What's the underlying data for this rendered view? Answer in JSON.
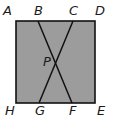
{
  "diagram": {
    "type": "geometry",
    "colors": {
      "fill": "#9c9c9c",
      "stroke": "#111111",
      "label": "#1a1a1a"
    },
    "rectangle": {
      "vertices": [
        "A",
        "D",
        "E",
        "H"
      ],
      "x": 16,
      "y": 21,
      "width": 79,
      "height": 82
    },
    "segments": [
      {
        "name": "BF",
        "from": "B",
        "to": "F",
        "x1": 38,
        "y1": 21,
        "x2": 72,
        "y2": 103
      },
      {
        "name": "CG",
        "from": "C",
        "to": "G",
        "x1": 73,
        "y1": 21,
        "x2": 39,
        "y2": 103
      }
    ],
    "intersection": {
      "name": "P",
      "x": 55.5,
      "y": 62
    },
    "labels": {
      "A": "A",
      "B": "B",
      "C": "C",
      "D": "D",
      "E": "E",
      "F": "F",
      "G": "G",
      "H": "H",
      "P": "P"
    }
  }
}
